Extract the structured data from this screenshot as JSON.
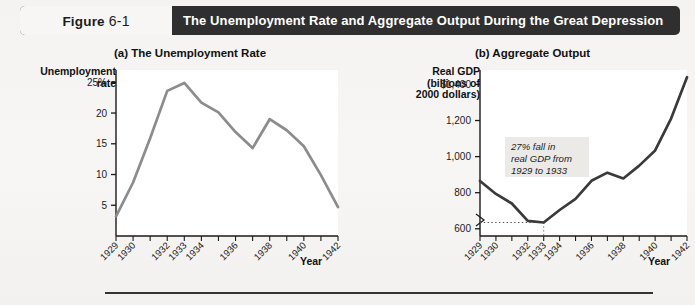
{
  "header": {
    "figure_label": "Figure",
    "figure_number": "6-1",
    "title": "The Unemployment Rate and Aggregate Output During the Great Depression"
  },
  "panel_a": {
    "title": "(a) The Unemployment Rate",
    "y_caption_line1": "Unemployment",
    "y_caption_line2": "rate",
    "x_caption": "Year"
  },
  "panel_b": {
    "title": "(b) Aggregate Output",
    "y_caption_line1": "Real GDP",
    "y_caption_line2": "(billions of",
    "y_caption_line3": "2000 dollars)",
    "x_caption": "Year",
    "annotation_line1": "27% fall in",
    "annotation_line2": "real GDP from",
    "annotation_line3": "1929 to 1933"
  },
  "colors": {
    "header_bar": "#2f2f2f",
    "page_background": "#f5f4f2",
    "unemployment_line": "#8c8c8c",
    "gdp_line": "#3a3a3a",
    "plot_background": "#ffffff",
    "axis": "#1a1a1a"
  },
  "chart_data": [
    {
      "type": "line",
      "title": "(a) The Unemployment Rate",
      "xlabel": "Year",
      "ylabel": "Unemployment rate",
      "ylim": [
        0,
        27
      ],
      "xlim": [
        1929,
        1942
      ],
      "grid": false,
      "legend": "none",
      "y_ticks": [
        5,
        10,
        15,
        20,
        25
      ],
      "y_tick_labels": [
        "5",
        "10",
        "15",
        "20",
        "25%"
      ],
      "x_ticks": [
        1929,
        1930,
        1931,
        1932,
        1933,
        1934,
        1935,
        1936,
        1937,
        1938,
        1939,
        1940,
        1941,
        1942
      ],
      "x_tick_labels": [
        "1929",
        "1930",
        "",
        "1932",
        "1933",
        "1934",
        "",
        "1936",
        "",
        "1938",
        "",
        "1940",
        "",
        "1942"
      ],
      "x": [
        1929,
        1930,
        1931,
        1932,
        1933,
        1934,
        1935,
        1936,
        1937,
        1938,
        1939,
        1940,
        1941,
        1942
      ],
      "values": [
        3.2,
        8.7,
        15.9,
        23.6,
        24.9,
        21.7,
        20.1,
        16.9,
        14.3,
        19.0,
        17.2,
        14.6,
        9.9,
        4.7
      ],
      "units": "percent"
    },
    {
      "type": "line",
      "title": "(b) Aggregate Output",
      "xlabel": "Year",
      "ylabel": "Real GDP (billions of 2000 dollars)",
      "ylim": [
        560,
        1480
      ],
      "xlim": [
        1929,
        1942
      ],
      "grid": false,
      "legend": "none",
      "axis_break": true,
      "y_ticks": [
        600,
        800,
        1000,
        1200,
        1400
      ],
      "y_tick_labels": [
        "600",
        "800",
        "1,000",
        "1,200",
        "$1,400"
      ],
      "x_ticks": [
        1929,
        1930,
        1931,
        1932,
        1933,
        1934,
        1935,
        1936,
        1937,
        1938,
        1939,
        1940,
        1941,
        1942
      ],
      "x_tick_labels": [
        "1929",
        "1930",
        "",
        "1932",
        "1933",
        "1934",
        "",
        "1936",
        "",
        "1938",
        "",
        "1940",
        "",
        "1942"
      ],
      "x": [
        1929,
        1930,
        1931,
        1932,
        1933,
        1934,
        1935,
        1936,
        1937,
        1938,
        1939,
        1940,
        1941,
        1942
      ],
      "values": [
        865,
        793,
        740,
        644,
        635,
        704,
        766,
        866,
        911,
        879,
        950,
        1034,
        1211,
        1440
      ],
      "units": "billions of 2000 dollars",
      "annotation": "27% fall in real GDP from 1929 to 1933",
      "reference_line_value": 635
    }
  ]
}
